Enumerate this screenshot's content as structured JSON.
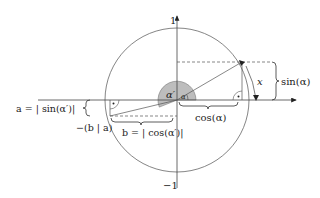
{
  "diagram": {
    "axis_labels": {
      "y_top": "1",
      "y_bottom": "−1"
    },
    "angles": {
      "alpha": "α",
      "alpha_prime": "α′"
    },
    "labels": {
      "sin_alpha": "sin(α)",
      "cos_alpha": "cos(α)",
      "x": "x",
      "a_eq": "a = | sin(α′)|",
      "b_eq": "b = | cos(α′)|",
      "point_neg": "−(b | a)"
    },
    "colors": {
      "stroke": "#555555",
      "angle_fill": "#bdbdbd",
      "text": "#222222"
    }
  }
}
